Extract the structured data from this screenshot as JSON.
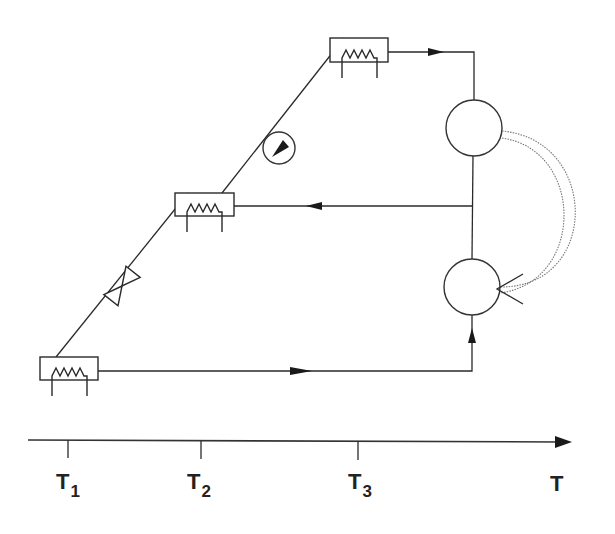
{
  "diagram": {
    "type": "refrigeration-cycle-temperature-diagram",
    "axis": {
      "label": "T",
      "ticks": [
        {
          "main": "T",
          "sub": "1",
          "x": 68
        },
        {
          "main": "T",
          "sub": "2",
          "x": 201
        },
        {
          "main": "T",
          "sub": "3",
          "x": 358
        }
      ]
    },
    "components": [
      {
        "id": "heat-exchanger-low",
        "kind": "heat-exchanger",
        "level": "T1"
      },
      {
        "id": "expansion-valve",
        "kind": "valve"
      },
      {
        "id": "heat-exchanger-mid",
        "kind": "heat-exchanger",
        "level": "T2"
      },
      {
        "id": "pump",
        "kind": "pump"
      },
      {
        "id": "heat-exchanger-high",
        "kind": "heat-exchanger",
        "level": "T3"
      },
      {
        "id": "upper-machine",
        "kind": "circle"
      },
      {
        "id": "lower-machine",
        "kind": "circle"
      },
      {
        "id": "work-transfer",
        "kind": "dotted-arc-arrow"
      }
    ],
    "colors": {
      "line": "#2a2a2a",
      "dotted": "#777777",
      "background": "#ffffff"
    }
  }
}
